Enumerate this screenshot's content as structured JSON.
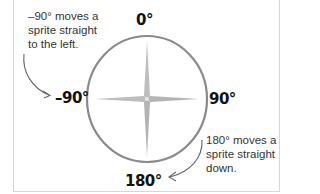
{
  "diagram": {
    "labels": {
      "up": "0°",
      "right": "90°",
      "left": "–90°",
      "down": "180°"
    },
    "notes": {
      "left": "–90° moves a sprite straight to the left.",
      "right": "180° moves a sprite straight down."
    },
    "colors": {
      "circle": "#8a8a8a",
      "star": "#b8b8b8",
      "arrow": "#666666",
      "frame": "#d6d6d6",
      "text": "#111111"
    }
  }
}
